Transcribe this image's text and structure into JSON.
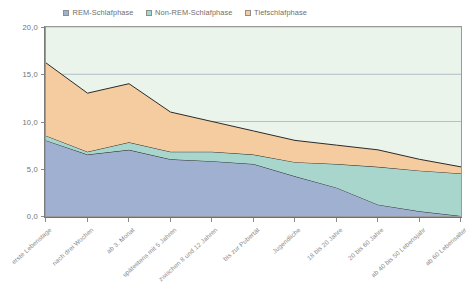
{
  "legend": {
    "position": "top",
    "items": [
      {
        "label": "REM-Schlafphase",
        "color": "#9fb0d0",
        "name": "rem"
      },
      {
        "label": "Non-REM-Schlafphase",
        "color": "#a8d5cc",
        "name": "non-rem"
      },
      {
        "label": "Tiefschlafphase",
        "color": "#f5cca0",
        "name": "tiefschlaf"
      }
    ]
  },
  "axes": {
    "y_ticks": [
      "0,0",
      "5,0",
      "10,0",
      "15,0",
      "20,0"
    ],
    "y_values": [
      0,
      5,
      10,
      15,
      20
    ],
    "x_labels": [
      "erste Lebenstage",
      "nach drei Wochen",
      "ab 3. Monat",
      "spätestens mit 5 Jahren",
      "zwischen 8 und 12 Jahren",
      "bis zur Pubertät",
      "Jugendliche",
      "18 bis 20 Jahre",
      "20 bis 60 Jahre",
      "ab 40 bis 50 Lebensjahr",
      "ab 60 Lebensalter"
    ]
  },
  "chart_data": {
    "type": "area",
    "stacked": true,
    "title": "",
    "subtitle": "",
    "xlabel": "",
    "ylabel": "",
    "ylim": [
      0,
      20
    ],
    "grid": true,
    "legend_position": "top",
    "categories": [
      "erste Lebenstage",
      "nach drei Wochen",
      "ab 3. Monat",
      "spätestens mit 5 Jahren",
      "zwischen 8 und 12 Jahren",
      "bis zur Pubertät",
      "Jugendliche",
      "18 bis 20 Jahre",
      "20 bis 60 Jahre",
      "ab 40 bis 50 Lebensjahr",
      "ab 60 Lebensalter"
    ],
    "series": [
      {
        "name": "REM-Schlafphase",
        "color": "#9fb0d0",
        "values": [
          8.0,
          6.5,
          7.0,
          6.0,
          5.8,
          5.5,
          4.2,
          3.0,
          1.2,
          0.5,
          0.0
        ]
      },
      {
        "name": "Non-REM-Schlafphase",
        "color": "#a8d5cc",
        "values": [
          0.5,
          0.3,
          0.8,
          0.8,
          1.0,
          1.0,
          1.5,
          2.5,
          4.0,
          4.3,
          4.5
        ]
      },
      {
        "name": "Tiefschlafphase",
        "color": "#f5cca0",
        "values": [
          7.7,
          6.2,
          6.2,
          4.2,
          3.2,
          2.5,
          2.3,
          2.0,
          1.8,
          1.2,
          0.7
        ]
      }
    ],
    "totals": [
      16.2,
      13.0,
      14.0,
      11.0,
      10.0,
      9.0,
      8.0,
      7.5,
      7.0,
      6.0,
      5.2
    ]
  },
  "plot_style": {
    "background": "#eaf4ea",
    "gridline_color": "#9aa9b8",
    "border_color": "#9a9a9a",
    "line_color": "#2b2b2b"
  }
}
